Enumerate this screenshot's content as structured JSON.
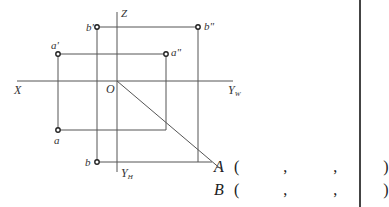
{
  "diagram": {
    "type": "three-view projection (descriptive geometry)",
    "axes": {
      "x_label": "X",
      "z_label": "Z",
      "yw_label": "Y",
      "yw_sub": "W",
      "yh_label": "Y",
      "yh_sub": "H",
      "origin_label": "O"
    },
    "points": {
      "a_prime": "a'",
      "a_double_prime": "a\"",
      "a": "a",
      "b_prime": "b'",
      "b_double_prime": "b\"",
      "b": "b"
    },
    "colors": {
      "line": "#555555",
      "point": "#222222",
      "text": "#333333"
    }
  },
  "answers": [
    {
      "label": "A",
      "open": "(",
      "sep1": ",",
      "sep2": ",",
      "close": ")"
    },
    {
      "label": "B",
      "open": "(",
      "sep1": ",",
      "sep2": ",",
      "close": ")"
    }
  ]
}
